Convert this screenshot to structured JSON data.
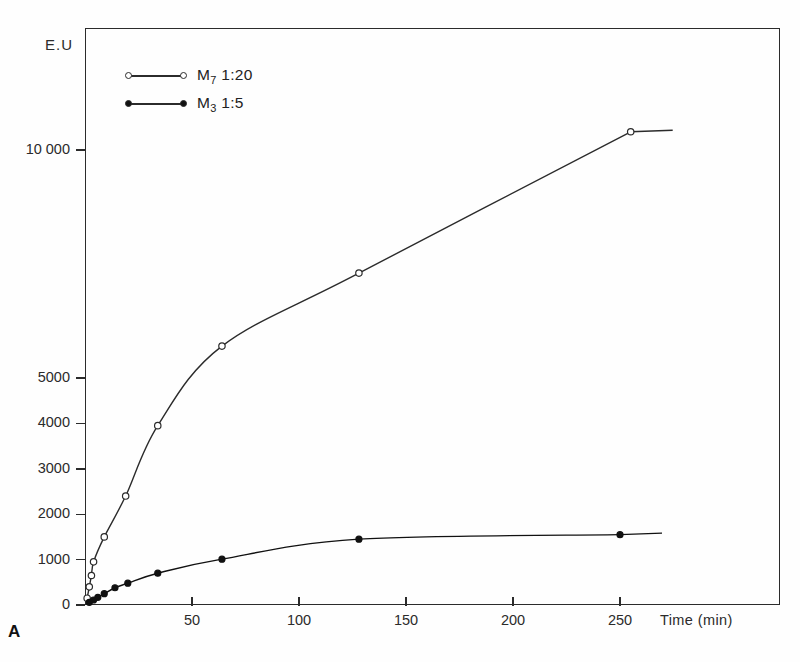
{
  "figure": {
    "panel_label": "A",
    "y_axis_label": "E.U",
    "x_axis_label": "Time (min)"
  },
  "legend": {
    "entries": [
      {
        "label": "M",
        "sub": "7",
        "ratio": "1:20",
        "marker": "open-circle",
        "name": "legend-item-m7"
      },
      {
        "label": "M",
        "sub": "3",
        "ratio": "1:5",
        "marker": "filled-circle",
        "name": "legend-item-m3"
      }
    ]
  },
  "axes": {
    "y_ticks": [
      {
        "value": 0,
        "label": "0"
      },
      {
        "value": 1000,
        "label": "1000"
      },
      {
        "value": 2000,
        "label": "2000"
      },
      {
        "value": 3000,
        "label": "3000"
      },
      {
        "value": 4000,
        "label": "4000"
      },
      {
        "value": 5000,
        "label": "5000"
      },
      {
        "value": 10000,
        "label": "10 000"
      }
    ],
    "x_ticks": [
      {
        "value": 50,
        "label": "50"
      },
      {
        "value": 100,
        "label": "100"
      },
      {
        "value": 150,
        "label": "150"
      },
      {
        "value": 200,
        "label": "200"
      },
      {
        "value": 250,
        "label": "250"
      }
    ]
  },
  "chart_data": {
    "type": "line",
    "title": "",
    "xlabel": "Time (min)",
    "ylabel": "E.U",
    "xlim": [
      0,
      325
    ],
    "ylim": [
      0,
      11000
    ],
    "grid": false,
    "legend_position": "top-left",
    "note": "y-axis is piecewise: linear 0-5000, compressed 5000-10000",
    "series": [
      {
        "name": "M7 1:20",
        "marker": "open-circle",
        "color": "#2b2b2b",
        "points": [
          {
            "x": 1,
            "y": 150
          },
          {
            "x": 2,
            "y": 400
          },
          {
            "x": 3,
            "y": 650
          },
          {
            "x": 4,
            "y": 950
          },
          {
            "x": 9,
            "y": 1500
          },
          {
            "x": 19,
            "y": 2400
          },
          {
            "x": 34,
            "y": 3950
          },
          {
            "x": 64,
            "y": 5700
          },
          {
            "x": 128,
            "y": 7300
          },
          {
            "x": 255,
            "y": 10400
          }
        ]
      },
      {
        "name": "M3 1:5",
        "marker": "filled-circle",
        "color": "#111111",
        "points": [
          {
            "x": 2,
            "y": 60
          },
          {
            "x": 4,
            "y": 110
          },
          {
            "x": 6,
            "y": 170
          },
          {
            "x": 9,
            "y": 250
          },
          {
            "x": 14,
            "y": 380
          },
          {
            "x": 20,
            "y": 480
          },
          {
            "x": 34,
            "y": 700
          },
          {
            "x": 64,
            "y": 1010
          },
          {
            "x": 128,
            "y": 1450
          },
          {
            "x": 250,
            "y": 1550
          }
        ]
      }
    ]
  }
}
